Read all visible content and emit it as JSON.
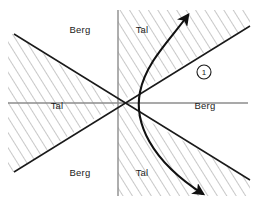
{
  "figure": {
    "type": "technical-line-diagram",
    "background_color": "#ffffff",
    "line_color": "#1a1a1a",
    "axis_color": "#8c8c8c",
    "hatch_color": "#9a9a9a",
    "origin": {
      "x": 118,
      "y": 103
    }
  },
  "axes": {
    "horizontal": {
      "x1": 8,
      "y1": 103,
      "x2": 248,
      "y2": 103
    },
    "vertical": {
      "x1": 118,
      "y1": 10,
      "x2": 118,
      "y2": 196
    }
  },
  "diagonals": [
    {
      "name": "diagonal-down-right",
      "x1": 14,
      "y1": 34,
      "x2": 250,
      "y2": 180
    },
    {
      "name": "diagonal-up-right",
      "x1": 14,
      "y1": 172,
      "x2": 250,
      "y2": 26
    }
  ],
  "labels": [
    {
      "id": "berg-top-left",
      "text": "Berg",
      "x": 80,
      "y": 33
    },
    {
      "id": "tal-top-right",
      "text": "Tal",
      "x": 142,
      "y": 33
    },
    {
      "id": "tal-left",
      "text": "Tal",
      "x": 57,
      "y": 109
    },
    {
      "id": "berg-right",
      "text": "Berg",
      "x": 205,
      "y": 109
    },
    {
      "id": "berg-bottom-left",
      "text": "Berg",
      "x": 80,
      "y": 176
    },
    {
      "id": "tal-bottom-right",
      "text": "Tal",
      "x": 142,
      "y": 176
    }
  ],
  "callout": {
    "id": "callout-one",
    "text": "1",
    "cx": 204,
    "cy": 72,
    "r": 7
  },
  "curve": {
    "name": "trajectory-curve",
    "path": "M 188 15 C 170 40, 146 62, 140 92 C 134 122, 150 160, 203 194",
    "arrow_start": {
      "x": 188,
      "y": 13,
      "angle": -52
    },
    "arrow_end": {
      "x": 205,
      "y": 196,
      "angle": 36
    }
  },
  "hatch_regions": [
    {
      "id": "hatch-left-wedge"
    },
    {
      "id": "hatch-right-upper"
    },
    {
      "id": "hatch-right-lower"
    }
  ]
}
